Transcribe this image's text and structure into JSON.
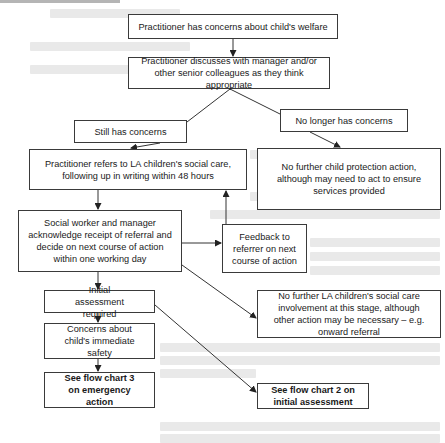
{
  "diagram": {
    "type": "flowchart",
    "nodes": {
      "n1": {
        "label": "Practitioner has concerns about child's welfare"
      },
      "n2": {
        "label": "Practitioner discusses with manager and/or other senior colleagues as they think appropriate"
      },
      "n3": {
        "label": "Still has concerns"
      },
      "n4": {
        "label": "No longer has concerns"
      },
      "n5": {
        "label": "Practitioner refers to LA children's social care, following up in writing within 48 hours"
      },
      "n6": {
        "label": "No further child protection action, although may need to act to ensure services provided"
      },
      "n7": {
        "label": "Social worker and manager acknowledge receipt of referral and decide on next course of action within one working day"
      },
      "n8": {
        "label": "Feedback to referrer on next course of action"
      },
      "n9": {
        "label": "Initial assessment required"
      },
      "n10": {
        "label": "No further LA children's social care involvement at this stage, although other action may be necessary – e.g. onward referral"
      },
      "n11": {
        "label": "Concerns about child's immediate safety"
      },
      "n12": {
        "label": "See flow chart 3 on emergency action"
      },
      "n13": {
        "label": "See flow chart 2 on initial assessment"
      }
    },
    "edges": [
      {
        "from": "n1",
        "to": "n2"
      },
      {
        "from": "n2",
        "to": "n3"
      },
      {
        "from": "n2",
        "to": "n4"
      },
      {
        "from": "n3",
        "to": "n5"
      },
      {
        "from": "n4",
        "to": "n6"
      },
      {
        "from": "n5",
        "to": "n7"
      },
      {
        "from": "n7",
        "to": "n8"
      },
      {
        "from": "n8",
        "to": "n5"
      },
      {
        "from": "n7",
        "to": "n9"
      },
      {
        "from": "n7",
        "to": "n10"
      },
      {
        "from": "n9",
        "to": "n11"
      },
      {
        "from": "n9",
        "to": "n13"
      },
      {
        "from": "n11",
        "to": "n12"
      }
    ],
    "colors": {
      "border": "#3a3a3a",
      "line": "#333333",
      "background": "#ffffff"
    }
  }
}
